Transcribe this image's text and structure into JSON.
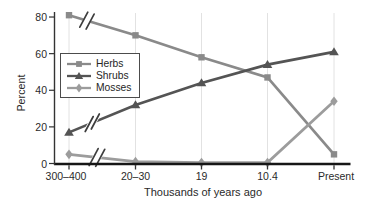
{
  "colors": {
    "background": "#ffffff",
    "x_axis": "#161616",
    "y_axis": "#333333",
    "gridline": "#e2e2e2",
    "text": "#2a2a2a",
    "break_slash": "#3d3d3d",
    "legend_border": "#4c4c4c"
  },
  "chart_data": {
    "type": "line",
    "title": "",
    "ylabel": "Percent",
    "xlabel": "Thousands of years ago",
    "categories": [
      "300–400",
      "20–30",
      "19",
      "10.4",
      "Present"
    ],
    "y_ticks": [
      0,
      20,
      40,
      60,
      80
    ],
    "ylim": [
      0,
      84
    ],
    "grid": "light vertical gridline at each category",
    "legend_position": "upper left inside plot area",
    "axis_break": "double-slash time-scale break marks between 300–400 and 20–30 on all three series",
    "series": [
      {
        "name": "Herbs",
        "marker": "square",
        "color": "#8a8a8a",
        "values": [
          81,
          70,
          58,
          47,
          5
        ]
      },
      {
        "name": "Shrubs",
        "marker": "triangle",
        "color": "#545454",
        "values": [
          17,
          32,
          44,
          54,
          61
        ]
      },
      {
        "name": "Mosses",
        "marker": "diamond",
        "color": "#9c9c9c",
        "values": [
          5,
          1,
          0.5,
          0.5,
          34
        ]
      }
    ]
  }
}
